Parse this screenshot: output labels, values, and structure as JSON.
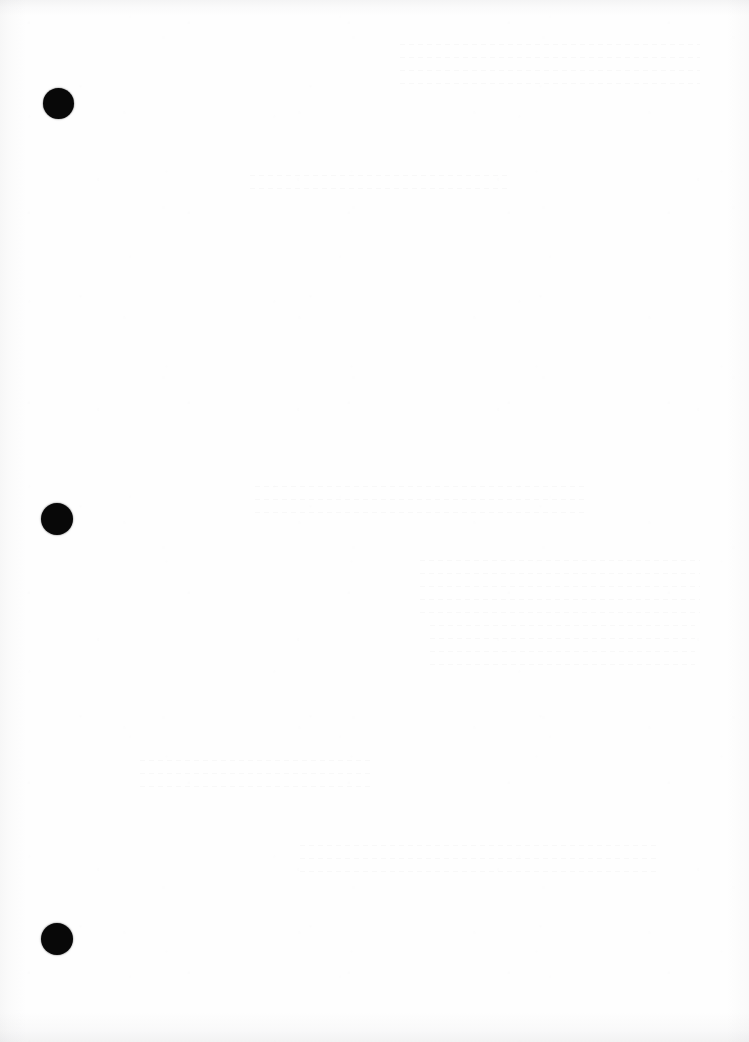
{
  "page": {
    "kind": "scanned-blank-page",
    "width": 749,
    "height": 1042,
    "background_color": "#ffffff",
    "paper_color": "#fefefe",
    "visible_text": "",
    "note": "Blank scanned sheet — no text, headings, tables or captions are rendered in the pixels."
  },
  "marks": {
    "label": "registration-marks",
    "color": "#080808",
    "shape": "filled-circle",
    "count": 3,
    "items": [
      {
        "name": "mark-top",
        "cx": 58,
        "cy": 103,
        "diameter": 31
      },
      {
        "name": "mark-middle",
        "cx": 57,
        "cy": 519,
        "diameter": 32
      },
      {
        "name": "mark-bottom",
        "cx": 57,
        "cy": 939,
        "diameter": 32
      }
    ]
  },
  "artifacts": {
    "edge_shadow_color": "#7a7a80",
    "grain_color": "#96969e",
    "ghost_color": "#5a5a64",
    "regions": [
      {
        "name": "top-edge-band",
        "x": 0,
        "y": 0,
        "width": 749,
        "height": 16
      },
      {
        "name": "bottom-edge-band",
        "x": 0,
        "y": 1012,
        "width": 749,
        "height": 30
      },
      {
        "name": "left-edge-shadow",
        "x": 0,
        "y": 0,
        "width": 26,
        "height": 1042
      },
      {
        "name": "right-edge-shadow",
        "x": 727,
        "y": 0,
        "width": 22,
        "height": 1042
      }
    ],
    "ghost_blocks": [
      {
        "name": "ghost-top-right",
        "x": 400,
        "y": 44,
        "width": 300,
        "height": 42
      },
      {
        "name": "ghost-upper-centre",
        "x": 250,
        "y": 175,
        "width": 260,
        "height": 26
      },
      {
        "name": "ghost-mid-left",
        "x": 255,
        "y": 486,
        "width": 330,
        "height": 34
      },
      {
        "name": "ghost-mid-right",
        "x": 420,
        "y": 560,
        "width": 280,
        "height": 60
      },
      {
        "name": "ghost-lower-right",
        "x": 430,
        "y": 625,
        "width": 265,
        "height": 48
      },
      {
        "name": "ghost-lower-left",
        "x": 140,
        "y": 760,
        "width": 230,
        "height": 30
      },
      {
        "name": "ghost-bottom-band",
        "x": 300,
        "y": 845,
        "width": 360,
        "height": 38
      }
    ]
  }
}
